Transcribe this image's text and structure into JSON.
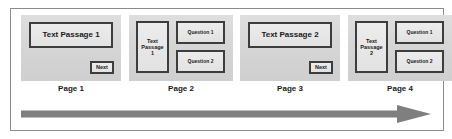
{
  "diagram": {
    "colors": {
      "panel_fill": "#d7d7d7",
      "box_fill": "#e6e6e6",
      "box_border": "#3d3d3d",
      "frame_border": "#8c8c8c",
      "arrow": "#7f7f7f",
      "text": "#1a1a1a"
    },
    "pages": [
      {
        "caption": "Page 1",
        "layout": "passage-with-next",
        "passage_label": "Text Passage 1",
        "next_label": "Next"
      },
      {
        "caption": "Page 2",
        "layout": "passage-with-questions",
        "passage_line1": "Text",
        "passage_line2": "Passage",
        "passage_line3": "1",
        "question1_label": "Question 1",
        "question2_label": "Question 2"
      },
      {
        "caption": "Page 3",
        "layout": "passage-with-next",
        "passage_label": "Text Passage 2",
        "next_label": "Next"
      },
      {
        "caption": "Page 4",
        "layout": "passage-with-questions",
        "passage_line1": "Text",
        "passage_line2": "Passage",
        "passage_line3": "2",
        "question1_label": "Question 1",
        "question2_label": "Question 2"
      }
    ],
    "flow_arrow": {
      "direction": "right",
      "label": ""
    }
  }
}
